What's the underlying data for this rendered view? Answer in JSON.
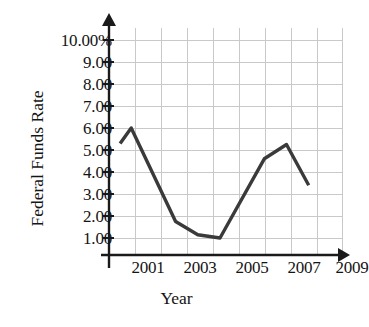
{
  "chart_data": {
    "type": "line",
    "title": "",
    "xlabel": "Year",
    "ylabel": "Federal Funds Rate",
    "x": [
      1999.5,
      2000,
      2002,
      2003,
      2004,
      2006,
      2007,
      2008
    ],
    "values": [
      5.3,
      6.0,
      1.75,
      1.15,
      1.0,
      4.6,
      5.25,
      3.4
    ],
    "series": [
      {
        "name": "Federal Funds Rate",
        "values": [
          5.3,
          6.0,
          1.75,
          1.15,
          1.0,
          4.6,
          5.25,
          3.4
        ]
      }
    ],
    "xtick_labels": [
      "2001",
      "2003",
      "2005",
      "2007",
      "2009"
    ],
    "xtick_values": [
      2001,
      2003,
      2005,
      2007,
      2009
    ],
    "ytick_labels": [
      "10.00%",
      "9.00",
      "8.00",
      "7.00",
      "6.00",
      "5.00",
      "4.00",
      "3.00",
      "2.00",
      "1.00"
    ],
    "ytick_values": [
      10,
      9,
      8,
      7,
      6,
      5,
      4,
      3,
      2,
      1
    ],
    "ylim": [
      0,
      10
    ],
    "xlim": [
      1999,
      2009.5
    ],
    "grid": true,
    "legend": "none",
    "line_color": "#3a3a3a",
    "grid_color": "#c9c9c9",
    "axis_color": "#1a1a1a"
  },
  "axes": {
    "y_label": "Federal Funds Rate",
    "x_label": "Year"
  },
  "yticks": [
    {
      "label": "10.00%"
    },
    {
      "label": "9.00"
    },
    {
      "label": "8.00"
    },
    {
      "label": "7.00"
    },
    {
      "label": "6.00"
    },
    {
      "label": "5.00"
    },
    {
      "label": "4.00"
    },
    {
      "label": "3.00"
    },
    {
      "label": "2.00"
    },
    {
      "label": "1.00"
    }
  ],
  "xticks": [
    {
      "label": "2001"
    },
    {
      "label": "2003"
    },
    {
      "label": "2005"
    },
    {
      "label": "2007"
    },
    {
      "label": "2009"
    }
  ]
}
